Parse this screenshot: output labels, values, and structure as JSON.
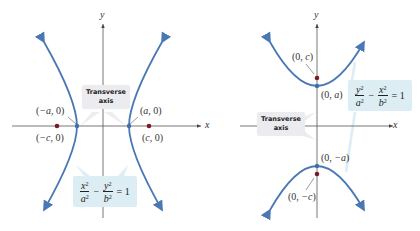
{
  "colors": {
    "curve": "#4a78b5",
    "focus_dot": "#7a1b2a",
    "vertex_dot": "#3f6ea8",
    "axis": "#555555",
    "callout_gray": "#ecebef",
    "callout_blue": "#dcedf3"
  },
  "left": {
    "axis_x_label": "x",
    "axis_y_label": "y",
    "callout_line1": "Transverse",
    "callout_line2": "axis",
    "vertex_left": {
      "open": "(",
      "var": "−a",
      "rest": ", 0)"
    },
    "vertex_right": {
      "open": "(",
      "var": "a",
      "rest": ", 0)"
    },
    "focus_left": {
      "open": "(",
      "var": "−c",
      "rest": ", 0)"
    },
    "focus_right": {
      "open": "(",
      "var": "c",
      "rest": ", 0)"
    },
    "equation": {
      "t1_num": "x",
      "t1_den": "a",
      "exp": "2",
      "op": "−",
      "t2_num": "y",
      "t2_den": "b",
      "eq": "= 1"
    }
  },
  "right": {
    "axis_x_label": "x",
    "axis_y_label": "y",
    "callout_line1": "Transverse",
    "callout_line2": "axis",
    "vertex_top": {
      "open": "(0, ",
      "var": "a",
      "rest": ")"
    },
    "vertex_bottom": {
      "open": "(0, ",
      "var": "−a",
      "rest": ")"
    },
    "focus_top": {
      "open": "(0, ",
      "var": "c",
      "rest": ")"
    },
    "focus_bottom": {
      "open": "(0, ",
      "var": "−c",
      "rest": ")"
    },
    "equation": {
      "t1_num": "y",
      "t1_den": "a",
      "exp": "2",
      "op": "−",
      "t2_num": "x",
      "t2_den": "b",
      "eq": "= 1"
    }
  }
}
